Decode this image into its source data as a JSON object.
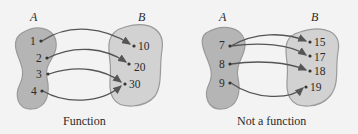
{
  "diagrams": [
    {
      "caption": "Function",
      "set_a_label": "A",
      "set_b_label": "B",
      "domain": [
        "1",
        "2",
        "3",
        "4"
      ],
      "codomain": [
        "10",
        "20",
        "30"
      ],
      "mappings": [
        [
          "1",
          "10"
        ],
        [
          "2",
          "20"
        ],
        [
          "3",
          "30"
        ],
        [
          "4",
          "30"
        ]
      ]
    },
    {
      "caption": "Not a function",
      "set_a_label": "A",
      "set_b_label": "B",
      "domain": [
        "7",
        "8",
        "9"
      ],
      "codomain": [
        "15",
        "17",
        "18",
        "19"
      ],
      "mappings": [
        [
          "7",
          "15"
        ],
        [
          "7",
          "17"
        ],
        [
          "8",
          "18"
        ],
        [
          "9",
          "19"
        ]
      ]
    }
  ],
  "colors": {
    "background": "#f3f3f3",
    "set_a_fill": "#b5b5b5",
    "set_b_fill": "#d2d2d2",
    "outline": "#9a9a9a",
    "arrow": "#555555",
    "text": "#2a2a2a"
  }
}
